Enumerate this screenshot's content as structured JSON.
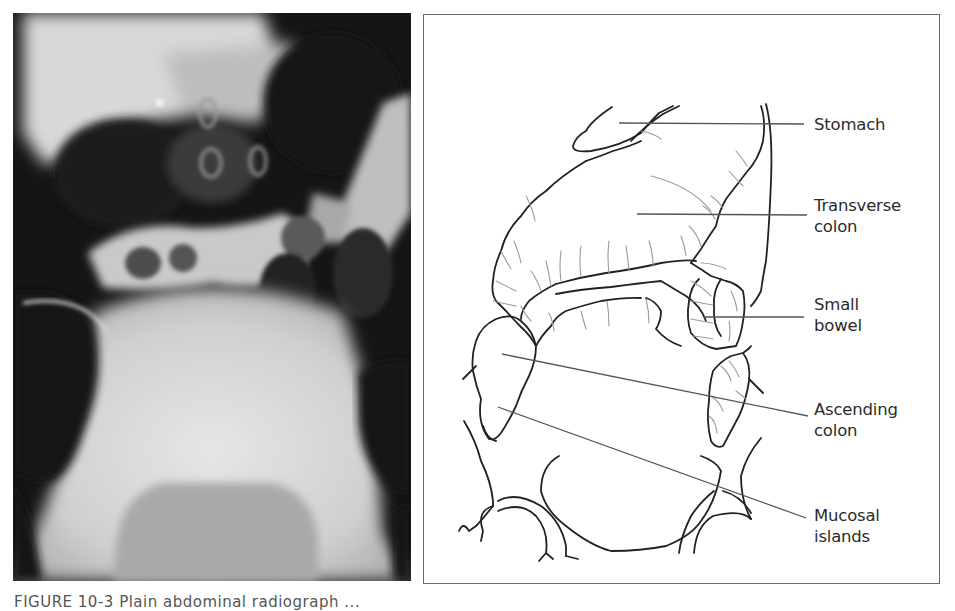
{
  "figure": {
    "caption_partial": "FIGURE 10-3  Plain abdominal radiograph ...",
    "left_panel": {
      "type": "radiograph",
      "description": "Abdominal plain film X-ray"
    },
    "right_panel": {
      "type": "line-drawing",
      "description": "Labeled schematic of the radiograph",
      "labels": [
        {
          "id": "stomach",
          "lines": [
            "Stomach"
          ]
        },
        {
          "id": "transverse-colon",
          "lines": [
            "Transverse",
            "colon"
          ]
        },
        {
          "id": "small-bowel",
          "lines": [
            "Small",
            "bowel"
          ]
        },
        {
          "id": "ascending-colon",
          "lines": [
            "Ascending",
            "colon"
          ]
        },
        {
          "id": "mucosal-islands",
          "lines": [
            "Mucosal",
            "islands"
          ]
        }
      ]
    }
  },
  "colors": {
    "ink": "#222222",
    "leader": "#555555",
    "fold": "#999999",
    "border": "#6a6a6a"
  }
}
